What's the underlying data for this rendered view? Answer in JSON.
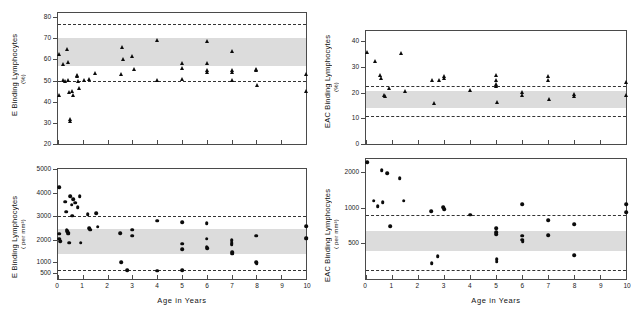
{
  "figure": {
    "x_axis_title": "Age  in  Years",
    "x_ticks": [
      "0",
      "1",
      "2",
      "3",
      "4",
      "5",
      "6",
      "7",
      "8",
      "9",
      "10"
    ]
  },
  "chart_data": [
    {
      "type": "scatter",
      "panel": "top-left",
      "title": "",
      "ylabel": "E  Binding  Lymphocytes",
      "ylabel_units": "(%)",
      "xlabel": "Age  in  Years",
      "ylim": [
        20,
        82
      ],
      "xlim": [
        0,
        10
      ],
      "y_ticks": [
        20,
        30,
        40,
        50,
        60,
        70,
        80
      ],
      "x_ticks": [
        0,
        1,
        2,
        3,
        4,
        5,
        6,
        7,
        8,
        9,
        10
      ],
      "grid": false,
      "legend": "none",
      "marker": "triangle",
      "shaded_band": [
        57,
        70
      ],
      "dashed_lines": [
        77,
        50
      ],
      "points": [
        {
          "x": 0.05,
          "y": 62.5
        },
        {
          "x": 0.05,
          "y": 43.0
        },
        {
          "x": 0.22,
          "y": 58.0
        },
        {
          "x": 0.22,
          "y": 50.3
        },
        {
          "x": 0.3,
          "y": 50.0
        },
        {
          "x": 0.38,
          "y": 64.8
        },
        {
          "x": 0.4,
          "y": 58.8
        },
        {
          "x": 0.42,
          "y": 50.5
        },
        {
          "x": 0.45,
          "y": 44.5
        },
        {
          "x": 0.48,
          "y": 31.8
        },
        {
          "x": 0.48,
          "y": 31.0
        },
        {
          "x": 0.55,
          "y": 45.2
        },
        {
          "x": 0.62,
          "y": 43.0
        },
        {
          "x": 0.75,
          "y": 52.5
        },
        {
          "x": 0.78,
          "y": 52.0
        },
        {
          "x": 0.8,
          "y": 49.8
        },
        {
          "x": 0.85,
          "y": 46.5
        },
        {
          "x": 1.05,
          "y": 50.5
        },
        {
          "x": 1.25,
          "y": 51.0
        },
        {
          "x": 1.5,
          "y": 53.5
        },
        {
          "x": 2.55,
          "y": 53.0
        },
        {
          "x": 2.6,
          "y": 65.8
        },
        {
          "x": 2.62,
          "y": 60.0
        },
        {
          "x": 3.0,
          "y": 61.5
        },
        {
          "x": 3.05,
          "y": 55.5
        },
        {
          "x": 4.0,
          "y": 69.3
        },
        {
          "x": 4.0,
          "y": 50.3
        },
        {
          "x": 5.0,
          "y": 58.5
        },
        {
          "x": 5.0,
          "y": 56.0
        },
        {
          "x": 5.02,
          "y": 51.0
        },
        {
          "x": 6.0,
          "y": 68.8
        },
        {
          "x": 6.0,
          "y": 58.2
        },
        {
          "x": 6.02,
          "y": 54.8
        },
        {
          "x": 6.02,
          "y": 54.0
        },
        {
          "x": 7.0,
          "y": 64.0
        },
        {
          "x": 7.0,
          "y": 55.0
        },
        {
          "x": 7.02,
          "y": 54.0
        },
        {
          "x": 7.02,
          "y": 50.5
        },
        {
          "x": 8.0,
          "y": 55.5
        },
        {
          "x": 8.0,
          "y": 54.8
        },
        {
          "x": 8.02,
          "y": 48.0
        },
        {
          "x": 10.0,
          "y": 53.2
        },
        {
          "x": 10.0,
          "y": 45.2
        }
      ]
    },
    {
      "type": "scatter",
      "panel": "bottom-left",
      "title": "",
      "ylabel": "E  Binding  Lymphocytes",
      "ylabel_units": "( per  mm³)",
      "xlabel": "Age  in  Years",
      "ylim": [
        300,
        5000
      ],
      "xlim": [
        0,
        10
      ],
      "y_ticks": [
        500,
        1000,
        2000,
        3000,
        4000,
        5000
      ],
      "x_ticks": [
        0,
        1,
        2,
        3,
        4,
        5,
        6,
        7,
        8,
        9,
        10
      ],
      "grid": false,
      "legend": "none",
      "marker": "dot",
      "shaded_band": [
        1350,
        2450
      ],
      "dashed_lines": [
        3000,
        640
      ],
      "points": [
        {
          "x": 0.05,
          "y": 4220
        },
        {
          "x": 0.05,
          "y": 2250
        },
        {
          "x": 0.05,
          "y": 2050
        },
        {
          "x": 0.08,
          "y": 1950
        },
        {
          "x": 0.3,
          "y": 3600
        },
        {
          "x": 0.32,
          "y": 3180
        },
        {
          "x": 0.35,
          "y": 2420
        },
        {
          "x": 0.38,
          "y": 2350
        },
        {
          "x": 0.4,
          "y": 2300
        },
        {
          "x": 0.42,
          "y": 2260
        },
        {
          "x": 0.45,
          "y": 1880
        },
        {
          "x": 0.5,
          "y": 3850
        },
        {
          "x": 0.55,
          "y": 3480
        },
        {
          "x": 0.58,
          "y": 3000
        },
        {
          "x": 0.62,
          "y": 3720
        },
        {
          "x": 0.7,
          "y": 3560
        },
        {
          "x": 0.8,
          "y": 3380
        },
        {
          "x": 0.88,
          "y": 3850
        },
        {
          "x": 0.92,
          "y": 1880
        },
        {
          "x": 1.2,
          "y": 3060
        },
        {
          "x": 1.25,
          "y": 2480
        },
        {
          "x": 1.3,
          "y": 2430
        },
        {
          "x": 1.55,
          "y": 3120
        },
        {
          "x": 1.6,
          "y": 2550
        },
        {
          "x": 2.5,
          "y": 2280
        },
        {
          "x": 2.55,
          "y": 980
        },
        {
          "x": 2.8,
          "y": 620
        },
        {
          "x": 3.0,
          "y": 2420
        },
        {
          "x": 3.0,
          "y": 2180
        },
        {
          "x": 4.0,
          "y": 2800
        },
        {
          "x": 4.0,
          "y": 600
        },
        {
          "x": 5.0,
          "y": 2740
        },
        {
          "x": 5.0,
          "y": 1830
        },
        {
          "x": 5.0,
          "y": 1580
        },
        {
          "x": 5.02,
          "y": 620
        },
        {
          "x": 6.0,
          "y": 2680
        },
        {
          "x": 6.0,
          "y": 2050
        },
        {
          "x": 6.0,
          "y": 1700
        },
        {
          "x": 6.02,
          "y": 1620
        },
        {
          "x": 7.0,
          "y": 1980
        },
        {
          "x": 7.0,
          "y": 1850
        },
        {
          "x": 7.0,
          "y": 1780
        },
        {
          "x": 7.02,
          "y": 1450
        },
        {
          "x": 7.02,
          "y": 1380
        },
        {
          "x": 8.0,
          "y": 2180
        },
        {
          "x": 8.0,
          "y": 990
        },
        {
          "x": 8.02,
          "y": 950
        },
        {
          "x": 10.0,
          "y": 2560
        },
        {
          "x": 10.0,
          "y": 2100
        },
        {
          "x": 10.0,
          "y": 2050
        }
      ]
    },
    {
      "type": "scatter",
      "panel": "top-right",
      "title": "",
      "ylabel": "EAC  Binding  Lymphocytes",
      "ylabel_units": "(%)",
      "xlabel": "Age  in  Years",
      "ylim": [
        0,
        44
      ],
      "xlim": [
        0,
        10
      ],
      "y_ticks": [
        0,
        10,
        20,
        30,
        40
      ],
      "x_ticks": [
        0,
        1,
        2,
        3,
        4,
        5,
        6,
        7,
        8,
        9,
        10
      ],
      "grid": false,
      "legend": "none",
      "marker": "triangle",
      "shaded_band": [
        14,
        20.5
      ],
      "dashed_lines": [
        22.5,
        11
      ],
      "points": [
        {
          "x": 0.05,
          "y": 36.0
        },
        {
          "x": 0.35,
          "y": 32.3
        },
        {
          "x": 0.55,
          "y": 26.8
        },
        {
          "x": 0.58,
          "y": 25.8
        },
        {
          "x": 0.7,
          "y": 19.2
        },
        {
          "x": 0.72,
          "y": 18.8
        },
        {
          "x": 0.9,
          "y": 21.8
        },
        {
          "x": 1.35,
          "y": 35.5
        },
        {
          "x": 1.5,
          "y": 20.5
        },
        {
          "x": 2.55,
          "y": 24.8
        },
        {
          "x": 2.6,
          "y": 16.0
        },
        {
          "x": 2.8,
          "y": 25.0
        },
        {
          "x": 3.0,
          "y": 26.5
        },
        {
          "x": 3.0,
          "y": 25.8
        },
        {
          "x": 4.0,
          "y": 21.2
        },
        {
          "x": 5.0,
          "y": 26.8
        },
        {
          "x": 5.0,
          "y": 25.0
        },
        {
          "x": 5.0,
          "y": 23.5
        },
        {
          "x": 5.0,
          "y": 22.5
        },
        {
          "x": 5.02,
          "y": 16.5
        },
        {
          "x": 6.0,
          "y": 20.2
        },
        {
          "x": 6.0,
          "y": 19.2
        },
        {
          "x": 7.0,
          "y": 26.5
        },
        {
          "x": 7.0,
          "y": 24.8
        },
        {
          "x": 7.02,
          "y": 17.5
        },
        {
          "x": 8.0,
          "y": 19.5
        },
        {
          "x": 8.0,
          "y": 18.8
        },
        {
          "x": 10.0,
          "y": 24.0
        },
        {
          "x": 10.0,
          "y": 19.0
        }
      ]
    },
    {
      "type": "scatter",
      "panel": "bottom-right",
      "title": "",
      "ylabel": "EAC  Binding  Lymphocytes",
      "ylabel_units": "( per  mm³)",
      "xlabel": "Age  in  Years",
      "ylim": [
        250,
        2600
      ],
      "xlim": [
        0,
        10
      ],
      "y_ticks": [
        500,
        1000,
        2000
      ],
      "x_ticks": [
        0,
        1,
        2,
        3,
        4,
        5,
        6,
        7,
        8,
        9,
        10
      ],
      "grid": false,
      "legend": "none",
      "marker": "dot",
      "shaded_band": [
        430,
        640
      ],
      "dashed_lines": [
        880,
        300
      ],
      "points": [
        {
          "x": 0.05,
          "y": 2450
        },
        {
          "x": 0.3,
          "y": 1150
        },
        {
          "x": 0.45,
          "y": 1030
        },
        {
          "x": 0.6,
          "y": 2080
        },
        {
          "x": 0.65,
          "y": 1120
        },
        {
          "x": 0.82,
          "y": 1960
        },
        {
          "x": 0.92,
          "y": 700
        },
        {
          "x": 1.3,
          "y": 1790
        },
        {
          "x": 1.45,
          "y": 1150
        },
        {
          "x": 2.5,
          "y": 940
        },
        {
          "x": 2.52,
          "y": 340
        },
        {
          "x": 2.75,
          "y": 390
        },
        {
          "x": 2.98,
          "y": 1010
        },
        {
          "x": 3.0,
          "y": 980
        },
        {
          "x": 4.0,
          "y": 880
        },
        {
          "x": 5.0,
          "y": 670
        },
        {
          "x": 5.0,
          "y": 620
        },
        {
          "x": 5.0,
          "y": 600
        },
        {
          "x": 5.02,
          "y": 370
        },
        {
          "x": 5.02,
          "y": 350
        },
        {
          "x": 6.0,
          "y": 1070
        },
        {
          "x": 6.0,
          "y": 580
        },
        {
          "x": 6.0,
          "y": 540
        },
        {
          "x": 6.02,
          "y": 520
        },
        {
          "x": 7.0,
          "y": 790
        },
        {
          "x": 7.0,
          "y": 590
        },
        {
          "x": 8.0,
          "y": 730
        },
        {
          "x": 8.0,
          "y": 400
        },
        {
          "x": 10.0,
          "y": 1080
        },
        {
          "x": 10.0,
          "y": 920
        }
      ]
    }
  ]
}
